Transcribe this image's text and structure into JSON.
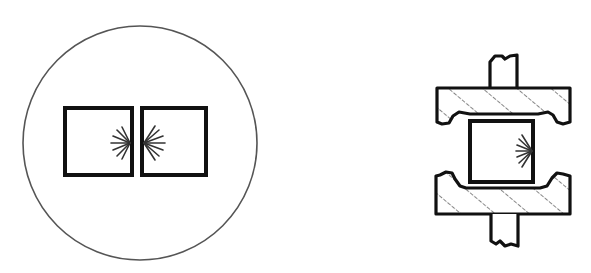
{
  "figure": {
    "left_panel": {
      "description": "circle enclosing two adjacent squares with radiating marks at the shared interface",
      "circle": {
        "cx": 140,
        "cy": 143,
        "r": 117
      },
      "squares": [
        {
          "x": 65,
          "y": 108,
          "w": 67,
          "h": 67
        },
        {
          "x": 142,
          "y": 108,
          "w": 64,
          "h": 67
        }
      ]
    },
    "right_panel": {
      "description": "square specimen clamped between two hatched plates with rods above and below; radiating marks on right side of specimen"
    },
    "colors": {
      "stroke": "#111111",
      "circle_stroke": "#555555",
      "background": "#ffffff"
    }
  }
}
